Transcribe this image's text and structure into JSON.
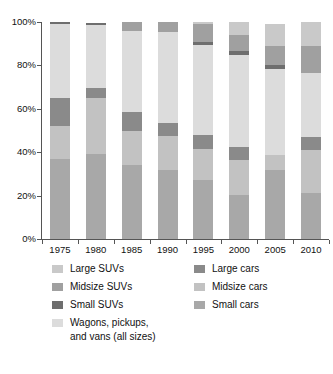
{
  "chart_data": {
    "type": "bar",
    "subtype": "stacked-percentage",
    "title": "",
    "subtitle": "",
    "xlabel": "",
    "ylabel": "",
    "categories": [
      "1975",
      "1980",
      "1985",
      "1990",
      "1995",
      "2000",
      "2005",
      "2010"
    ],
    "ylim": [
      0,
      100
    ],
    "ytick_labels": [
      "0%",
      "20%",
      "40%",
      "60%",
      "80%",
      "100%"
    ],
    "ytick_values": [
      0,
      20,
      40,
      60,
      80,
      100
    ],
    "grid": false,
    "legend_position": "bottom",
    "stack_order_bottom_to_top": [
      "Small cars",
      "Midsize cars",
      "Large cars",
      "Wagons, pickups, and vans (all sizes)",
      "Small SUVs",
      "Midsize SUVs",
      "Large SUVs"
    ],
    "series": [
      {
        "name": "Small cars",
        "values": [
          37.0,
          39.0,
          34.0,
          32.0,
          27.0,
          20.5,
          32.0,
          21.0
        ]
      },
      {
        "name": "Midsize cars",
        "values": [
          15.0,
          26.0,
          16.0,
          15.5,
          14.5,
          16.0,
          6.5,
          20.0
        ]
      },
      {
        "name": "Large cars",
        "values": [
          13.0,
          4.5,
          8.5,
          6.0,
          6.5,
          6.0,
          0.0,
          6.0
        ]
      },
      {
        "name": "Wagons, pickups, and vans (all sizes)",
        "values": [
          34.0,
          29.0,
          37.5,
          42.0,
          41.5,
          42.5,
          40.0,
          29.5
        ]
      },
      {
        "name": "Small SUVs",
        "values": [
          1.0,
          1.0,
          0.0,
          0.0,
          1.5,
          1.5,
          1.5,
          0.0
        ]
      },
      {
        "name": "Midsize SUVs",
        "values": [
          0.0,
          0.0,
          4.0,
          4.5,
          8.0,
          7.5,
          9.0,
          12.5
        ]
      },
      {
        "name": "Large SUVs",
        "values": [
          0.0,
          0.0,
          0.0,
          0.0,
          1.0,
          6.0,
          10.0,
          11.0
        ]
      }
    ],
    "colors": {
      "Large SUVs": "#c9c9c9",
      "Midsize SUVs": "#a0a0a0",
      "Small SUVs": "#6e6e6e",
      "Wagons, pickups, and vans (all sizes)": "#dcdcdc",
      "Large cars": "#8a8a8a",
      "Midsize cars": "#c2c2c2",
      "Small cars": "#a8a8a8"
    }
  },
  "legend": {
    "items": [
      {
        "label": "Large SUVs",
        "color": "#c9c9c9",
        "column": "left",
        "row": 0
      },
      {
        "label": "Midsize SUVs",
        "color": "#a0a0a0",
        "column": "left",
        "row": 1
      },
      {
        "label": "Small SUVs",
        "color": "#6e6e6e",
        "column": "left",
        "row": 2
      },
      {
        "label": "Wagons, pickups,\nand vans (all sizes)",
        "color": "#dcdcdc",
        "column": "left",
        "row": 3
      },
      {
        "label": "Large cars",
        "color": "#8a8a8a",
        "column": "right",
        "row": 0
      },
      {
        "label": "Midsize cars",
        "color": "#c2c2c2",
        "column": "right",
        "row": 1
      },
      {
        "label": "Small cars",
        "color": "#a8a8a8",
        "column": "right",
        "row": 2
      }
    ]
  }
}
